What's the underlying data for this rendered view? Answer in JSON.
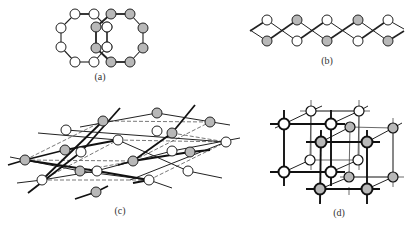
{
  "figure": {
    "panels": [
      {
        "id": "a",
        "label": "(a)",
        "description": "Two interlocking eight-membered rings"
      },
      {
        "id": "b",
        "label": "(b)",
        "description": "Two intertwined zig-zag chains"
      },
      {
        "id": "c",
        "label": "(c)",
        "description": "Interpenetrating layered (2D) nets"
      },
      {
        "id": "d",
        "label": "(d)",
        "description": "Two interpenetrating primitive cubic 3D networks"
      }
    ],
    "colors": {
      "node_white": "#ffffff",
      "node_gray": "#b8b8b8",
      "stroke": "#222222",
      "dashed": "#555555"
    }
  },
  "panel_a": {
    "white_nodes": [
      [
        75,
        14
      ],
      [
        94,
        14
      ],
      [
        61,
        28
      ],
      [
        61,
        47
      ],
      [
        75,
        62
      ],
      [
        94,
        62
      ],
      [
        107,
        27
      ],
      [
        107,
        47
      ]
    ],
    "white_edges": [
      [
        0,
        1
      ],
      [
        0,
        2
      ],
      [
        2,
        3
      ],
      [
        3,
        4
      ],
      [
        4,
        5
      ],
      [
        1,
        6
      ],
      [
        6,
        7
      ],
      [
        7,
        5
      ]
    ],
    "gray_nodes": [
      [
        111,
        14
      ],
      [
        130,
        14
      ],
      [
        143,
        28
      ],
      [
        143,
        48
      ],
      [
        130,
        62
      ],
      [
        111,
        62
      ],
      [
        96,
        48
      ],
      [
        96,
        27
      ]
    ],
    "gray_edges": [
      [
        0,
        1
      ],
      [
        1,
        2
      ],
      [
        2,
        3
      ],
      [
        3,
        4
      ],
      [
        4,
        5
      ],
      [
        5,
        6
      ],
      [
        6,
        7
      ],
      [
        7,
        0
      ]
    ]
  },
  "panel_b": {
    "top_y": 20,
    "bottom_y": 41,
    "xs": [
      267,
      297,
      327,
      358,
      388
    ],
    "top_colors": [
      "white",
      "gray",
      "white",
      "gray",
      "white"
    ],
    "bottom_colors": [
      "gray",
      "white",
      "gray",
      "white",
      "gray"
    ]
  },
  "panel_c": {
    "nodes": [
      {
        "x": 103,
        "y": 121,
        "c": "gray"
      },
      {
        "x": 66,
        "y": 130,
        "c": "white"
      },
      {
        "x": 65,
        "y": 150,
        "c": "gray"
      },
      {
        "x": 81,
        "y": 152,
        "c": "white"
      },
      {
        "x": 118,
        "y": 140,
        "c": "white"
      },
      {
        "x": 25,
        "y": 160,
        "c": "gray"
      },
      {
        "x": 80,
        "y": 171,
        "c": "gray"
      },
      {
        "x": 97,
        "y": 171,
        "c": "white"
      },
      {
        "x": 42,
        "y": 180,
        "c": "white"
      },
      {
        "x": 96,
        "y": 192,
        "c": "gray"
      },
      {
        "x": 157,
        "y": 113,
        "c": "gray"
      },
      {
        "x": 157,
        "y": 131,
        "c": "white"
      },
      {
        "x": 210,
        "y": 122,
        "c": "gray"
      },
      {
        "x": 172,
        "y": 133,
        "c": "gray"
      },
      {
        "x": 226,
        "y": 142,
        "c": "white"
      },
      {
        "x": 172,
        "y": 151,
        "c": "white"
      },
      {
        "x": 190,
        "y": 152,
        "c": "gray"
      },
      {
        "x": 133,
        "y": 161,
        "c": "gray"
      },
      {
        "x": 188,
        "y": 171,
        "c": "white"
      },
      {
        "x": 149,
        "y": 180,
        "c": "white"
      }
    ]
  },
  "panel_d": {
    "white_cube": [
      [
        284,
        124
      ],
      [
        331,
        124
      ],
      [
        284,
        172
      ],
      [
        331,
        172
      ],
      [
        311,
        111
      ],
      [
        359,
        111
      ],
      [
        310,
        160
      ],
      [
        358,
        160
      ]
    ],
    "gray_cube": [
      [
        321,
        142
      ],
      [
        367,
        142
      ],
      [
        320,
        189
      ],
      [
        367,
        189
      ],
      [
        350,
        127
      ],
      [
        393,
        128
      ],
      [
        349,
        177
      ],
      [
        393,
        177
      ]
    ]
  }
}
